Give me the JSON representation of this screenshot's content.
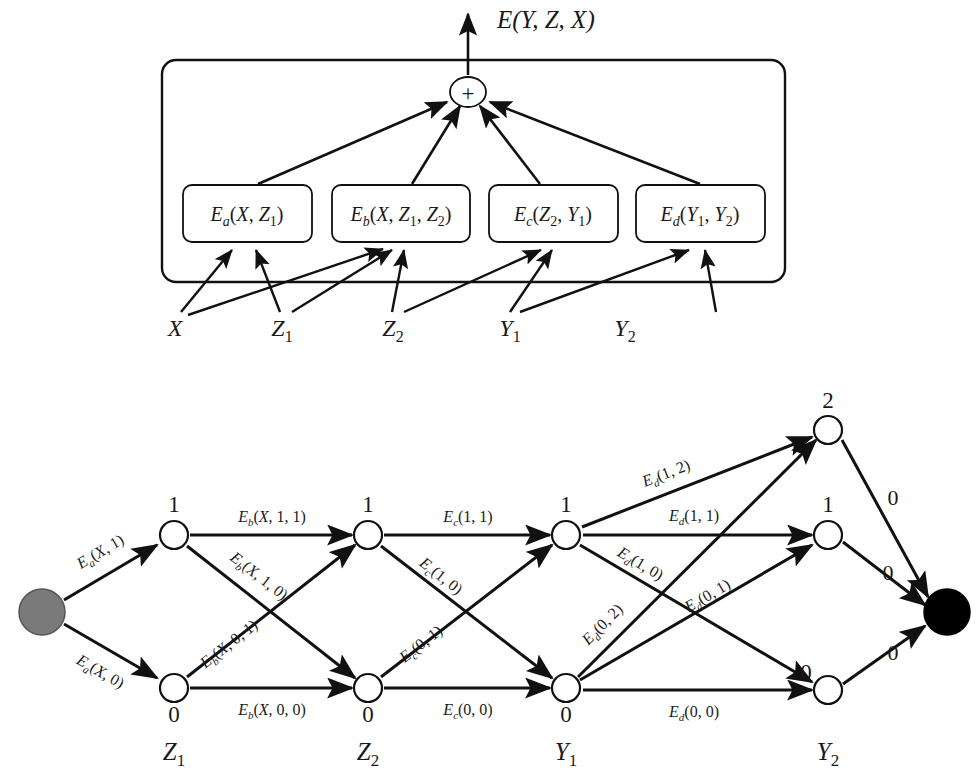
{
  "figure": {
    "title_output": "E(Y, Z, X)",
    "panels": [
      "factor-graph-panel",
      "trellis-panel"
    ]
  },
  "factor_graph": {
    "output_label": "E(Y, Z, X)",
    "sum_node_symbol": "+",
    "factors": [
      {
        "id": "Ea",
        "label": "E",
        "subscript": "a",
        "args": "(X, Z",
        "args_sub": "1",
        "args_tail": ")",
        "full": "E_a(X, Z_1)"
      },
      {
        "id": "Eb",
        "label": "E",
        "subscript": "b",
        "full": "E_b(X, Z_1, Z_2)"
      },
      {
        "id": "Ec",
        "label": "E",
        "subscript": "c",
        "full": "E_c(Z_2, Y_1)"
      },
      {
        "id": "Ed",
        "label": "E",
        "subscript": "d",
        "full": "E_d(Y_1, Y_2)"
      }
    ],
    "variables": [
      {
        "id": "X",
        "base": "X",
        "sub": ""
      },
      {
        "id": "Z1",
        "base": "Z",
        "sub": "1"
      },
      {
        "id": "Z2",
        "base": "Z",
        "sub": "2"
      },
      {
        "id": "Y1",
        "base": "Y",
        "sub": "1"
      },
      {
        "id": "Y2",
        "base": "Y",
        "sub": "2"
      }
    ]
  },
  "trellis": {
    "start_node_color": "#7a7a7a",
    "end_node_color": "#000000",
    "node_fill": "#ffffff",
    "stroke_color": "#111111",
    "columns": [
      {
        "id": "Z1",
        "base": "Z",
        "sub": "1",
        "states": [
          "1",
          "0"
        ]
      },
      {
        "id": "Z2",
        "base": "Z",
        "sub": "2",
        "states": [
          "1",
          "0"
        ]
      },
      {
        "id": "Y1",
        "base": "Y",
        "sub": "1",
        "states": [
          "1",
          "0"
        ]
      },
      {
        "id": "Y2",
        "base": "Y",
        "sub": "2",
        "states": [
          "2",
          "1",
          "0"
        ]
      }
    ],
    "edge_labels": {
      "start_to_Z1": [
        "E_a(X, 1)",
        "E_a(X, 0)"
      ],
      "Z1_to_Z2": [
        "E_b(X, 1, 1)",
        "E_b(X, 1, 0)",
        "E_b(X, 0, 1)",
        "E_b(X, 0, 0)"
      ],
      "Z2_to_Y1": [
        "E_c(1, 1)",
        "E_c(1, 0)",
        "E_c(0, 1)",
        "E_c(0, 0)"
      ],
      "Y1_to_Y2": [
        "E_d(1, 2)",
        "E_d(1, 1)",
        "E_d(1, 0)",
        "E_d(0, 2)",
        "E_d(0, 1)",
        "E_d(0, 0)"
      ],
      "Y2_to_end": [
        "0",
        "0",
        "0"
      ]
    },
    "edges": [
      {
        "name": "start-to-Z1-1",
        "from": "start",
        "to": "Z1.1",
        "label_base": "E",
        "label_sub": "a",
        "label_tail": "(X, 1)",
        "rotate": -32,
        "lx": 103,
        "ly": 556
      },
      {
        "name": "start-to-Z1-0",
        "from": "start",
        "to": "Z1.0",
        "label_base": "E",
        "label_sub": "a",
        "label_tail": "(X, 0)",
        "rotate": 32,
        "lx": 97,
        "ly": 672
      },
      {
        "name": "Z1-1-to-Z2-1",
        "label_base": "E",
        "label_sub": "b",
        "label_tail": "(X, 1, 1)",
        "rotate": 0,
        "lx": 270,
        "ly": 518
      },
      {
        "name": "Z1-1-to-Z2-0",
        "label_base": "E",
        "label_sub": "b",
        "label_tail": "(X, 1, 0)",
        "rotate": 40,
        "lx": 253,
        "ly": 578
      },
      {
        "name": "Z1-0-to-Z2-1",
        "label_base": "E",
        "label_sub": "b",
        "label_tail": "(X, 0, 1)",
        "rotate": -40,
        "lx": 233,
        "ly": 645
      },
      {
        "name": "Z1-0-to-Z2-0",
        "label_base": "E",
        "label_sub": "b",
        "label_tail": "(X, 0, 0)",
        "rotate": 0,
        "lx": 270,
        "ly": 712
      },
      {
        "name": "Z2-1-to-Y1-1",
        "label_base": "E",
        "label_sub": "c",
        "label_tail": "(1, 1)",
        "rotate": 0,
        "lx": 467,
        "ly": 518
      },
      {
        "name": "Z2-1-to-Y1-0",
        "label_base": "E",
        "label_sub": "c",
        "label_tail": "(1, 0)",
        "rotate": 40,
        "lx": 435,
        "ly": 578
      },
      {
        "name": "Z2-0-to-Y1-1",
        "label_base": "E",
        "label_sub": "c",
        "label_tail": "(0, 1)",
        "rotate": -40,
        "lx": 423,
        "ly": 645
      },
      {
        "name": "Z2-0-to-Y1-0",
        "label_base": "E",
        "label_sub": "c",
        "label_tail": "(0, 0)",
        "rotate": 0,
        "lx": 467,
        "ly": 712
      },
      {
        "name": "Y1-1-to-Y2-2",
        "label_base": "E",
        "label_sub": "d",
        "label_tail": "(1, 2)",
        "rotate": -20,
        "lx": 665,
        "ly": 478
      },
      {
        "name": "Y1-1-to-Y2-1",
        "label_base": "E",
        "label_sub": "d",
        "label_tail": "(1, 1)",
        "rotate": 0,
        "lx": 692,
        "ly": 518
      },
      {
        "name": "Y1-1-to-Y2-0",
        "label_base": "E",
        "label_sub": "d",
        "label_tail": "(1, 0)",
        "rotate": 40,
        "lx": 640,
        "ly": 567
      },
      {
        "name": "Y1-0-to-Y2-2",
        "label_base": "E",
        "label_sub": "d",
        "label_tail": "(0, 2)",
        "rotate": -58,
        "lx": 608,
        "ly": 625
      },
      {
        "name": "Y1-0-to-Y2-1",
        "label_base": "E",
        "label_sub": "d",
        "label_tail": "(0, 1)",
        "rotate": -36,
        "lx": 705,
        "ly": 598
      },
      {
        "name": "Y1-0-to-Y2-0",
        "label_base": "E",
        "label_sub": "d",
        "label_tail": "(0, 0)",
        "rotate": 0,
        "lx": 692,
        "ly": 712
      },
      {
        "name": "Y2-2-to-end",
        "label_base": "0",
        "label_sub": "",
        "label_tail": "",
        "rotate": 0,
        "lx": 893,
        "ly": 503
      },
      {
        "name": "Y2-1-to-end",
        "label_base": "0",
        "label_sub": "",
        "label_tail": "",
        "rotate": 0,
        "lx": 890,
        "ly": 577
      },
      {
        "name": "Y2-0-to-end",
        "label_base": "0",
        "label_sub": "",
        "label_tail": "",
        "rotate": 0,
        "lx": 893,
        "ly": 657
      }
    ]
  }
}
